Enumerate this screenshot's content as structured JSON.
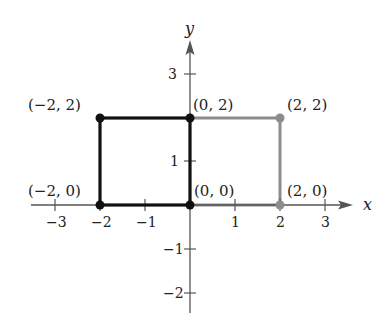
{
  "diagram": {
    "type": "coordinate-plane",
    "axes": {
      "x_label": "x",
      "y_label": "y",
      "x_ticks": [
        {
          "value": -3,
          "label": "−3"
        },
        {
          "value": -2,
          "label": "−2"
        },
        {
          "value": -1,
          "label": "−1"
        },
        {
          "value": 1,
          "label": "1"
        },
        {
          "value": 2,
          "label": "2"
        },
        {
          "value": 3,
          "label": "3"
        }
      ],
      "y_ticks": [
        {
          "value": 3,
          "label": "3"
        },
        {
          "value": 1,
          "label": "1"
        },
        {
          "value": -1,
          "label": "−1"
        },
        {
          "value": -2,
          "label": "−2"
        }
      ]
    },
    "squares": [
      {
        "name": "black-square",
        "color": "#111111",
        "vertices": [
          [
            -2,
            0
          ],
          [
            0,
            0
          ],
          [
            0,
            2
          ],
          [
            -2,
            2
          ]
        ]
      },
      {
        "name": "gray-square",
        "color": "#8c8c8c",
        "vertices": [
          [
            0,
            0
          ],
          [
            2,
            0
          ],
          [
            2,
            2
          ],
          [
            0,
            2
          ]
        ]
      }
    ],
    "points": [
      {
        "label": "(−2, 2)",
        "x": -2,
        "y": 2,
        "color": "#111111"
      },
      {
        "label": "(0, 2)",
        "x": 0,
        "y": 2,
        "color": "#111111"
      },
      {
        "label": "(2, 2)",
        "x": 2,
        "y": 2,
        "color": "#8c8c8c"
      },
      {
        "label": "(−2, 0)",
        "x": -2,
        "y": 0,
        "color": "#111111"
      },
      {
        "label": "(0, 0)",
        "x": 0,
        "y": 0,
        "color": "#111111"
      },
      {
        "label": "(2, 0)",
        "x": 2,
        "y": 0,
        "color": "#8c8c8c"
      }
    ]
  }
}
